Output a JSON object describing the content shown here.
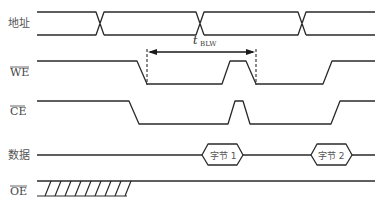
{
  "diagram": {
    "type": "timing-diagram",
    "signals": [
      {
        "id": "address",
        "label": "地址",
        "overbar": false
      },
      {
        "id": "we",
        "label": "WE",
        "overbar": true
      },
      {
        "id": "ce",
        "label": "CE",
        "overbar": true
      },
      {
        "id": "data",
        "label": "数据",
        "overbar": false
      },
      {
        "id": "oe",
        "label": "OE",
        "overbar": true
      }
    ],
    "timing": {
      "symbol": "t",
      "subscript": "BLW"
    },
    "data_bytes": [
      "字节 1",
      "字节 2"
    ],
    "caption": ""
  }
}
